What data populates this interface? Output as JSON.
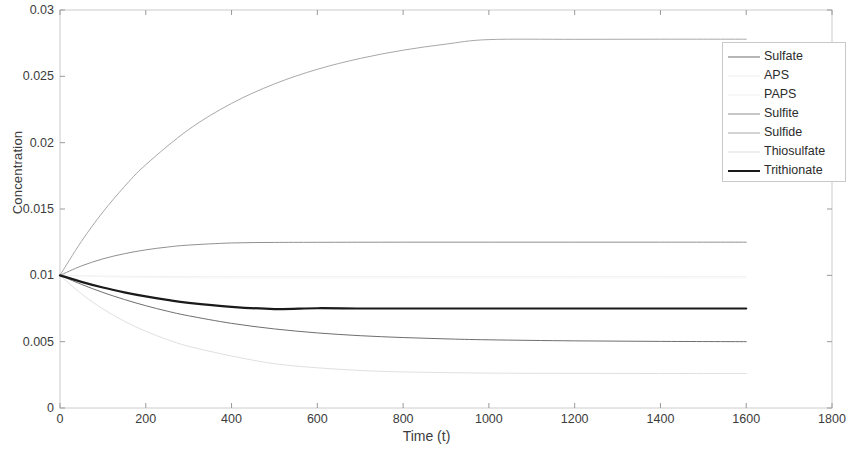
{
  "chart_data": {
    "type": "line",
    "title": "",
    "xlabel": "Time (t)",
    "ylabel": "Concentration",
    "xlim": [
      0,
      1800
    ],
    "ylim": [
      0,
      0.03
    ],
    "xticks": [
      0,
      200,
      400,
      600,
      800,
      1000,
      1200,
      1400,
      1600,
      1800
    ],
    "xtick_labels": [
      "0",
      "200",
      "400",
      "600",
      "800",
      "1000",
      "1200",
      "1400",
      "1600",
      "1800"
    ],
    "yticks": [
      0,
      0.005,
      0.01,
      0.015,
      0.02,
      0.025,
      0.03
    ],
    "ytick_labels": [
      "0",
      "0.005",
      "0.01",
      "0.015",
      "0.02",
      "0.025",
      "0.03"
    ],
    "grid": false,
    "legend_position": "upper right",
    "x_data_range": [
      0,
      1600
    ],
    "initial_value": 0.01,
    "series": [
      {
        "name": "Sulfate",
        "color": "#6e6e6e",
        "width": 1.0,
        "steady_state": 0.005,
        "tau": 330,
        "x": [
          0,
          50,
          100,
          150,
          200,
          250,
          300,
          400,
          500,
          600,
          700,
          800,
          900,
          1000,
          1200,
          1400,
          1600
        ],
        "values": [
          0.01,
          0.00932,
          0.00871,
          0.00818,
          0.00771,
          0.0073,
          0.00695,
          0.00638,
          0.00596,
          0.00566,
          0.00545,
          0.00531,
          0.00521,
          0.00514,
          0.00506,
          0.00502,
          0.005
        ]
      },
      {
        "name": "APS",
        "color": "#ededed",
        "width": 0.8,
        "steady_state": 0.0099,
        "tau": 200,
        "x": [
          0,
          100,
          200,
          400,
          600,
          800,
          1000,
          1200,
          1400,
          1600
        ],
        "values": [
          0.01,
          0.00995,
          0.00992,
          0.0099,
          0.0099,
          0.0099,
          0.0099,
          0.0099,
          0.0099,
          0.0099
        ]
      },
      {
        "name": "PAPS",
        "color": "#f2f2f2",
        "width": 0.8,
        "steady_state": 0.0098,
        "tau": 200,
        "x": [
          0,
          100,
          200,
          400,
          600,
          800,
          1000,
          1200,
          1400,
          1600
        ],
        "values": [
          0.01,
          0.0099,
          0.00984,
          0.0098,
          0.0098,
          0.0098,
          0.0098,
          0.0098,
          0.0098,
          0.0098
        ]
      },
      {
        "name": "Sulfite",
        "color": "#909090",
        "width": 1.0,
        "steady_state": 0.0125,
        "tau": 180,
        "x": [
          0,
          50,
          100,
          150,
          200,
          250,
          300,
          400,
          500,
          600,
          800,
          1000,
          1200,
          1400,
          1600
        ],
        "values": [
          0.01,
          0.01071,
          0.01124,
          0.01163,
          0.01192,
          0.01213,
          0.01228,
          0.01244,
          0.01248,
          0.01249,
          0.0125,
          0.0125,
          0.0125,
          0.0125,
          0.0125
        ]
      },
      {
        "name": "Sulfide",
        "color": "#a8a8a8",
        "width": 1.0,
        "steady_state": 0.0278,
        "tau": 330,
        "x": [
          0,
          50,
          100,
          150,
          200,
          300,
          400,
          500,
          600,
          700,
          800,
          900,
          1000,
          1200,
          1400,
          1600
        ],
        "values": [
          0.01,
          0.01256,
          0.01477,
          0.01668,
          0.01834,
          0.02099,
          0.02296,
          0.02443,
          0.02553,
          0.02635,
          0.02697,
          0.02743,
          0.02777,
          0.02779,
          0.0278,
          0.0278
        ]
      },
      {
        "name": "Thiosulfate",
        "color": "#e0e0e0",
        "width": 1.0,
        "steady_state": 0.0026,
        "tau": 240,
        "x": [
          0,
          50,
          100,
          150,
          200,
          250,
          300,
          400,
          500,
          600,
          700,
          800,
          1000,
          1200,
          1400,
          1600
        ],
        "values": [
          0.01,
          0.00861,
          0.00747,
          0.00654,
          0.00578,
          0.00516,
          0.00465,
          0.00392,
          0.00334,
          0.00303,
          0.00283,
          0.00272,
          0.00263,
          0.00261,
          0.0026,
          0.0026
        ]
      },
      {
        "name": "Trithionate",
        "color": "#1a1a1a",
        "width": 2.2,
        "steady_state": 0.0075,
        "tau": 200,
        "x": [
          0,
          50,
          100,
          150,
          200,
          250,
          300,
          400,
          500,
          600,
          700,
          800,
          1000,
          1200,
          1400,
          1600
        ],
        "values": [
          0.01,
          0.00951,
          0.00908,
          0.00872,
          0.00841,
          0.00815,
          0.00793,
          0.00763,
          0.00746,
          0.00752,
          0.0075,
          0.0075,
          0.0075,
          0.0075,
          0.0075,
          0.0075
        ]
      }
    ]
  },
  "axes": {
    "box_color": "#cccccc",
    "tick_color": "#999999",
    "text_color": "#3c3c3c"
  }
}
